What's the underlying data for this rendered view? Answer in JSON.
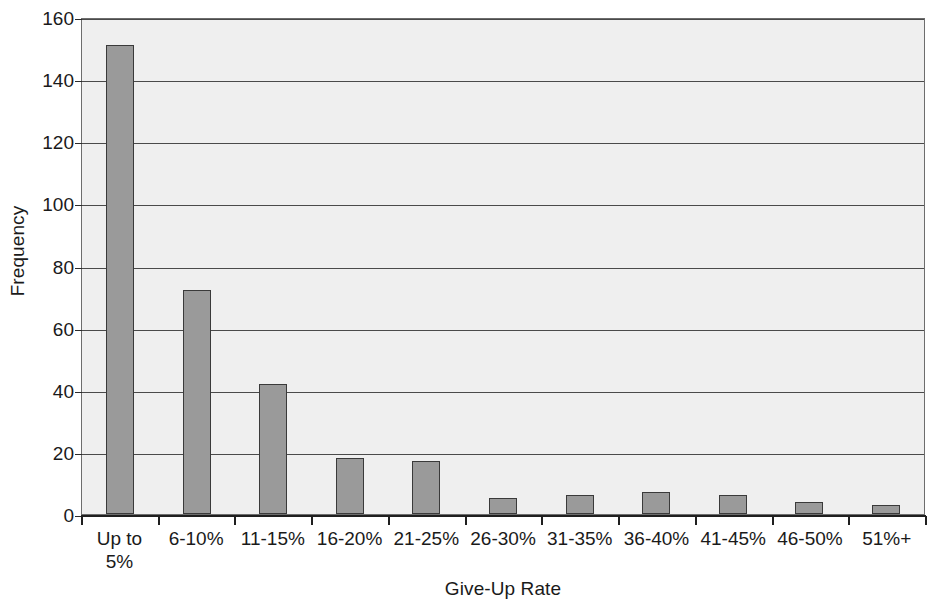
{
  "chart_data": {
    "type": "bar",
    "title": "",
    "subtitle": "",
    "xlabel": "Give-Up Rate",
    "ylabel": "Frequency",
    "categories": [
      "Up to\n5%",
      "6-10%",
      "11-15%",
      "16-20%",
      "21-25%",
      "26-30%",
      "31-35%",
      "36-40%",
      "41-45%",
      "46-50%",
      "51%+"
    ],
    "values": [
      151,
      72,
      42,
      18,
      17,
      5,
      6,
      7,
      6,
      4,
      3
    ],
    "ylim": [
      0,
      160
    ],
    "yticks": [
      0,
      20,
      40,
      60,
      80,
      100,
      120,
      140,
      160
    ],
    "ytick_labels": [
      "0",
      "20",
      "40",
      "60",
      "80",
      "100",
      "120",
      "140",
      "160"
    ],
    "grid": "horizontal",
    "legend": "none",
    "bar_color": "#9a9a9a",
    "bar_edge_color": "#3a3a3a",
    "plot_background": "#efefef",
    "gridline_color": "#4a4a4a",
    "axis_color": "#1f1f1f"
  }
}
